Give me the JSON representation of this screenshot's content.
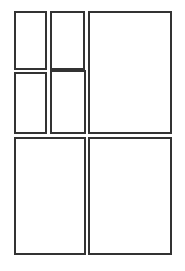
{
  "canvas": {
    "width": 185,
    "height": 271,
    "background_color": "#ffffff",
    "line_color": "#333333",
    "line_width_px": 2,
    "description": "Blank wireframe layout grid of seven empty rectangular panels"
  },
  "layout": {
    "columns": 2,
    "rows": 3,
    "panels": [
      {
        "id": "panel-top-left",
        "name": "top-left-panel",
        "label": "",
        "x": 14,
        "y": 11,
        "width": 33,
        "height": 59,
        "fill_color": "#ffffff",
        "border_color": "#333333"
      },
      {
        "id": "panel-top-middle",
        "name": "top-middle-panel",
        "label": "",
        "x": 50,
        "y": 11,
        "width": 35,
        "height": 59,
        "fill_color": "#ffffff",
        "border_color": "#333333"
      },
      {
        "id": "panel-top-right",
        "name": "top-right-panel",
        "label": "",
        "x": 88,
        "y": 11,
        "width": 84,
        "height": 123,
        "fill_color": "#ffffff",
        "border_color": "#333333"
      },
      {
        "id": "panel-middle-left",
        "name": "middle-left-panel",
        "label": "",
        "x": 14,
        "y": 72,
        "width": 33,
        "height": 62,
        "fill_color": "#ffffff",
        "border_color": "#333333"
      },
      {
        "id": "panel-middle-center",
        "name": "middle-center-panel",
        "label": "",
        "x": 50,
        "y": 70,
        "width": 36,
        "height": 64,
        "fill_color": "#ffffff",
        "border_color": "#333333"
      },
      {
        "id": "panel-bottom-left",
        "name": "bottom-left-panel",
        "label": "",
        "x": 14,
        "y": 137,
        "width": 72,
        "height": 118,
        "fill_color": "#ffffff",
        "border_color": "#333333"
      },
      {
        "id": "panel-bottom-right",
        "name": "bottom-right-panel",
        "label": "",
        "x": 88,
        "y": 137,
        "width": 84,
        "height": 118,
        "fill_color": "#ffffff",
        "border_color": "#333333"
      }
    ]
  }
}
